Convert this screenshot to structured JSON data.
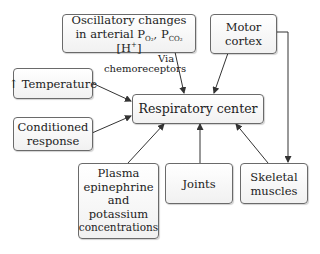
{
  "diagram": {
    "type": "flowchart",
    "center": {
      "label": "Respiratory center"
    },
    "nodes": [
      {
        "id": "oscillatory",
        "line1": "Oscillatory changes",
        "line2_prefix": "in arterial P",
        "po2_sub": "O₂",
        "comma": ", P",
        "pco2_sub": "CO₂",
        "h_open": " [H",
        "h_sup": "+",
        "h_close": "]"
      },
      {
        "id": "motor_cortex",
        "lines": [
          "Motor",
          "cortex"
        ]
      },
      {
        "id": "temperature",
        "arrow": "↑",
        "label": "Temperature"
      },
      {
        "id": "conditioned",
        "lines": [
          "Conditioned",
          "response"
        ]
      },
      {
        "id": "plasma",
        "lines": [
          "Plasma",
          "epinephrine",
          "and",
          "potassium",
          "concentrations"
        ]
      },
      {
        "id": "joints",
        "label": "Joints"
      },
      {
        "id": "skeletal",
        "lines": [
          "Skeletal",
          "muscles"
        ]
      }
    ],
    "edge_labels": {
      "via": "Via",
      "chemoreceptors": "chemoreceptors"
    },
    "edges": [
      {
        "from": "oscillatory",
        "to": "respiratory_center",
        "label": "Via chemoreceptors"
      },
      {
        "from": "motor_cortex",
        "to": "respiratory_center"
      },
      {
        "from": "motor_cortex",
        "to": "skeletal"
      },
      {
        "from": "temperature",
        "to": "respiratory_center"
      },
      {
        "from": "conditioned",
        "to": "respiratory_center"
      },
      {
        "from": "plasma",
        "to": "respiratory_center"
      },
      {
        "from": "joints",
        "to": "respiratory_center"
      },
      {
        "from": "skeletal",
        "to": "respiratory_center"
      }
    ],
    "colors": {
      "line": "#333333",
      "box_border": "#6a6a6a",
      "box_fill": "#f4f4f4"
    }
  }
}
